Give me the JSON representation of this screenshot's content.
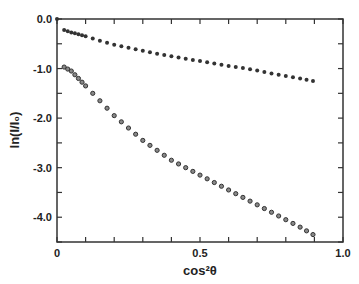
{
  "chart_data": {
    "type": "scatter",
    "title": "",
    "xlabel": "cos²θ",
    "ylabel": "ln(I/I₀)",
    "xlim": [
      0,
      1.0
    ],
    "ylim": [
      -4.5,
      0.0
    ],
    "xticks": [
      "0",
      "0.5",
      "1.0"
    ],
    "yticks": [
      "0.0",
      "-1.0",
      "-2.0",
      "-3.0",
      "-4.0"
    ],
    "grid": false,
    "legend": null,
    "series": [
      {
        "name": "upper (filled markers)",
        "marker": "filled-circle",
        "x": [
          0.025,
          0.05,
          0.075,
          0.1,
          0.15,
          0.2,
          0.25,
          0.3,
          0.35,
          0.4,
          0.45,
          0.5,
          0.55,
          0.6,
          0.65,
          0.7,
          0.75,
          0.8,
          0.85,
          0.895
        ],
        "y": [
          -0.22,
          -0.27,
          -0.31,
          -0.35,
          -0.44,
          -0.52,
          -0.58,
          -0.64,
          -0.7,
          -0.75,
          -0.8,
          -0.85,
          -0.9,
          -0.95,
          -0.99,
          -1.04,
          -1.1,
          -1.15,
          -1.2,
          -1.25
        ]
      },
      {
        "name": "lower (open markers)",
        "marker": "open-circle",
        "x": [
          0.025,
          0.05,
          0.075,
          0.1,
          0.15,
          0.2,
          0.25,
          0.3,
          0.35,
          0.4,
          0.45,
          0.5,
          0.55,
          0.6,
          0.65,
          0.7,
          0.75,
          0.8,
          0.85,
          0.895
        ],
        "y": [
          -0.97,
          -1.05,
          -1.2,
          -1.35,
          -1.65,
          -1.95,
          -2.2,
          -2.45,
          -2.65,
          -2.85,
          -3.0,
          -3.15,
          -3.3,
          -3.45,
          -3.6,
          -3.75,
          -3.9,
          -4.05,
          -4.2,
          -4.35
        ]
      }
    ]
  }
}
